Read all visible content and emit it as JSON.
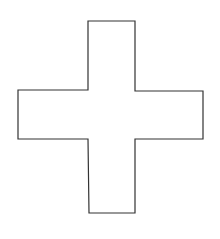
{
  "diagram": {
    "shape": "cross",
    "background_color": "#ffffff",
    "fill_color": "#ffffff",
    "stroke_color": "#333333",
    "stroke_width": 1.2,
    "vertices": [
      [
        88,
        21
      ],
      [
        135,
        21
      ],
      [
        135,
        91
      ],
      [
        203,
        91
      ],
      [
        203,
        139
      ],
      [
        135,
        139
      ],
      [
        135,
        213
      ],
      [
        89,
        213
      ],
      [
        88,
        139
      ],
      [
        18,
        139
      ],
      [
        18,
        90
      ],
      [
        88,
        90
      ]
    ]
  }
}
